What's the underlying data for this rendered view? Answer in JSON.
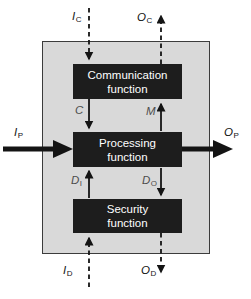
{
  "diagram": {
    "boxes": {
      "communication": {
        "line1": "Communication",
        "line2": "function"
      },
      "processing": {
        "line1": "Processing",
        "line2": "function"
      },
      "security": {
        "line1": "Security",
        "line2": "function"
      }
    },
    "labels": {
      "input_c": {
        "main": "I",
        "sub": "C"
      },
      "output_c": {
        "main": "O",
        "sub": "C"
      },
      "input_p": {
        "main": "I",
        "sub": "P"
      },
      "output_p": {
        "main": "O",
        "sub": "P"
      },
      "input_d": {
        "main": "I",
        "sub": "D"
      },
      "output_d": {
        "main": "O",
        "sub": "D"
      },
      "c_flow": {
        "main": "C",
        "sub": ""
      },
      "m_flow": {
        "main": "M",
        "sub": ""
      },
      "d_in": {
        "main": "D",
        "sub": "I"
      },
      "d_out": {
        "main": "D",
        "sub": "O"
      }
    },
    "flows": [
      {
        "name": "IC",
        "style": "dashed",
        "path": "external top into Communication function, arrow down"
      },
      {
        "name": "OC",
        "style": "dashed",
        "path": "Communication function out to external top, arrow up"
      },
      {
        "name": "IP",
        "style": "bold",
        "path": "external left into Processing function, arrow right"
      },
      {
        "name": "OP",
        "style": "bold",
        "path": "Processing function out to external right, arrow right"
      },
      {
        "name": "ID",
        "style": "dashed",
        "path": "external bottom into Security function, arrow up"
      },
      {
        "name": "OD",
        "style": "dashed",
        "path": "Security function out to external bottom, arrow down"
      },
      {
        "name": "C",
        "style": "solid",
        "path": "Communication function to Processing function, arrow down"
      },
      {
        "name": "M",
        "style": "solid",
        "path": "Processing function to Communication function, arrow up"
      },
      {
        "name": "DI",
        "style": "solid",
        "path": "Security function to Processing function, arrow up"
      },
      {
        "name": "DO",
        "style": "solid",
        "path": "Processing function to Security function, arrow down"
      }
    ],
    "colors": {
      "function_box_fill": "#1d1d1d",
      "function_box_text": "#ffffff",
      "outer_box_fill": "#d9d9d9",
      "outer_box_border": "#3c3c3c",
      "arrow": "#141414",
      "flow_label": "#4d4d4d",
      "io_label": "#141414",
      "background": "#ffffff"
    }
  }
}
